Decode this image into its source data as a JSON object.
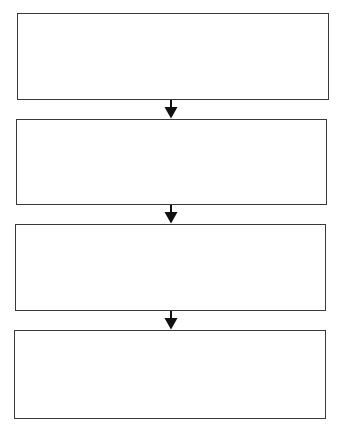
{
  "diagram": {
    "type": "flowchart",
    "direction": "top-to-bottom",
    "stroke_color": "#3a3a3a",
    "arrow_color": "#111111",
    "background": "#ffffff",
    "boxes": [
      {
        "id": "step-1",
        "label": ""
      },
      {
        "id": "step-2",
        "label": ""
      },
      {
        "id": "step-3",
        "label": ""
      },
      {
        "id": "step-4",
        "label": ""
      }
    ],
    "edges": [
      {
        "from": "step-1",
        "to": "step-2"
      },
      {
        "from": "step-2",
        "to": "step-3"
      },
      {
        "from": "step-3",
        "to": "step-4"
      }
    ]
  }
}
